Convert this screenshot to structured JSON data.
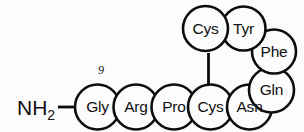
{
  "diagram": {
    "background_color": "#fcfcfc",
    "stroke_color": "#0d0d0d",
    "terminus": {
      "label_main": "NH",
      "label_sub": "2",
      "name": "amino-terminus"
    },
    "position_number": "9",
    "residues": [
      {
        "id": "gly",
        "label": "Gly",
        "cx": 97.5,
        "cy": 107,
        "r": 22.5,
        "row": "bottom"
      },
      {
        "id": "arg",
        "label": "Arg",
        "cx": 136.0,
        "cy": 107,
        "r": 22.5,
        "row": "bottom"
      },
      {
        "id": "pro",
        "label": "Pro",
        "cx": 174.0,
        "cy": 107,
        "r": 22.5,
        "row": "bottom"
      },
      {
        "id": "cys-bottom",
        "label": "Cys",
        "cx": 210.5,
        "cy": 107,
        "r": 22.5,
        "row": "bottom"
      },
      {
        "id": "asn",
        "label": "Asn",
        "cx": 249.5,
        "cy": 107,
        "r": 22.5,
        "row": "bottom"
      },
      {
        "id": "gln",
        "label": "Gln",
        "cx": 271.5,
        "cy": 90.0,
        "r": 22.5,
        "row": "right"
      },
      {
        "id": "phe",
        "label": "Phe",
        "cx": 274.0,
        "cy": 51.5,
        "r": 22.0,
        "row": "right"
      },
      {
        "id": "tyr",
        "label": "Tyr",
        "cx": 243.5,
        "cy": 28.5,
        "r": 22.0,
        "row": "top"
      },
      {
        "id": "cys-top",
        "label": "Cys",
        "cx": 205.5,
        "cy": 28.5,
        "r": 22.5,
        "row": "top"
      }
    ],
    "bonds": [
      {
        "id": "terminus-to-gly",
        "type": "horizontal",
        "x1": 58,
        "y1": 107,
        "x2": 75,
        "y2": 107
      },
      {
        "id": "disulfide-bridge",
        "type": "vertical",
        "x1": 208.5,
        "y1": 53,
        "x2": 208.5,
        "y2": 85
      }
    ]
  }
}
